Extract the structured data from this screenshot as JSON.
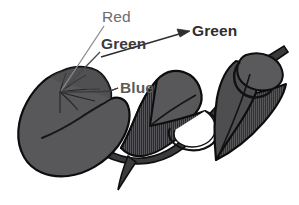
{
  "figure": {
    "kind": "botanical-leaf-diagram",
    "background_color": "#ffffff",
    "outline_color": "#111111",
    "leaf_fill_light": "#58585a",
    "leaf_fill_dark": "#2b2b2d",
    "stem_fill": "#3a3a3c",
    "labels": [
      {
        "id": "red",
        "text": "Red",
        "color": "#6d6d6f",
        "bold": false,
        "x": 102,
        "y": 9,
        "leader": "line-to-leaf-base"
      },
      {
        "id": "green-left",
        "text": "Green",
        "color": "#3b3b3d",
        "bold": true,
        "x": 101,
        "y": 36,
        "leader": "line-to-leaf-base"
      },
      {
        "id": "blue",
        "text": "Blue",
        "color": "#5a5a5c",
        "bold": true,
        "x": 120,
        "y": 80,
        "leader": "line-to-leaf-margin"
      },
      {
        "id": "green-right",
        "text": "Green",
        "color": "#2e2e30",
        "bold": true,
        "x": 192,
        "y": 23,
        "leader": "arrow-from-lower-left"
      }
    ]
  }
}
